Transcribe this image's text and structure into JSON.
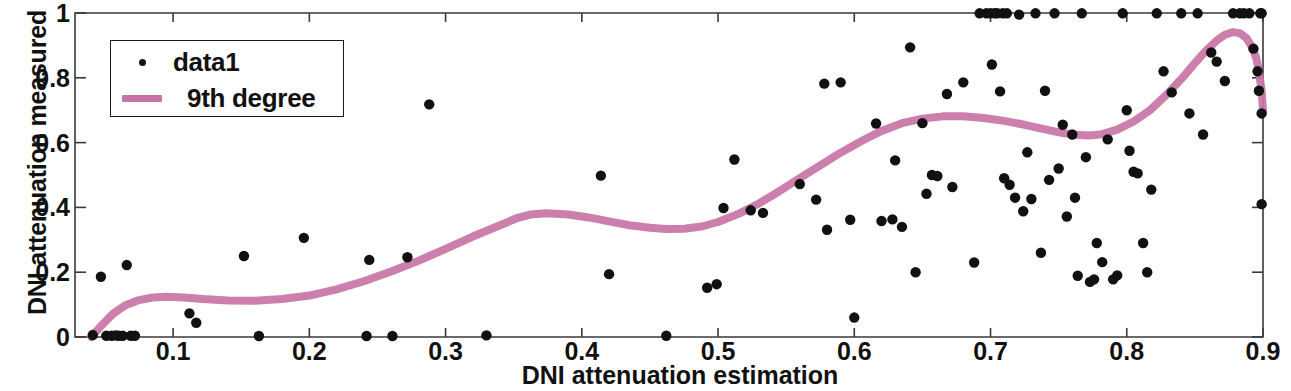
{
  "chart_data": {
    "type": "scatter",
    "title": "",
    "xlabel": "DNI attenuation estimation",
    "ylabel": "DNI attenuation measured",
    "xlim": [
      0.028,
      0.9
    ],
    "ylim": [
      0,
      1
    ],
    "xticks": [
      0.1,
      0.2,
      0.3,
      0.4,
      0.5,
      0.6,
      0.7,
      0.8,
      0.9
    ],
    "xticklabels": [
      "0.1",
      "0.2",
      "0.3",
      "0.4",
      "0.5",
      "0.6",
      "0.7",
      "0.8",
      "0.9"
    ],
    "yticks": [
      0,
      0.2,
      0.4,
      0.6,
      0.8,
      1
    ],
    "yticklabels": [
      "0",
      "0.2",
      "0.4",
      "0.6",
      "0.8",
      "1"
    ],
    "grid": false,
    "legend_position": "upper left",
    "marker_color": "#111111",
    "line_color": "#c873a6",
    "axis_color": "#3a3a3a",
    "series": [
      {
        "name": "data1",
        "type": "scatter",
        "marker": "dot",
        "color": "#111111",
        "points": [
          [
            0.041,
            0.006
          ],
          [
            0.047,
            0.186
          ],
          [
            0.051,
            0.004
          ],
          [
            0.055,
            0.004
          ],
          [
            0.058,
            0.005
          ],
          [
            0.06,
            0.004
          ],
          [
            0.063,
            0.004
          ],
          [
            0.066,
            0.222
          ],
          [
            0.069,
            0.004
          ],
          [
            0.072,
            0.004
          ],
          [
            0.112,
            0.073
          ],
          [
            0.117,
            0.044
          ],
          [
            0.152,
            0.25
          ],
          [
            0.163,
            0.003
          ],
          [
            0.196,
            0.306
          ],
          [
            0.242,
            0.003
          ],
          [
            0.244,
            0.238
          ],
          [
            0.261,
            0.003
          ],
          [
            0.272,
            0.246
          ],
          [
            0.288,
            0.718
          ],
          [
            0.33,
            0.005
          ],
          [
            0.414,
            0.498
          ],
          [
            0.42,
            0.194
          ],
          [
            0.462,
            0.004
          ],
          [
            0.492,
            0.152
          ],
          [
            0.499,
            0.163
          ],
          [
            0.504,
            0.398
          ],
          [
            0.512,
            0.548
          ],
          [
            0.524,
            0.391
          ],
          [
            0.533,
            0.383
          ],
          [
            0.56,
            0.472
          ],
          [
            0.572,
            0.424
          ],
          [
            0.578,
            0.782
          ],
          [
            0.58,
            0.331
          ],
          [
            0.59,
            0.786
          ],
          [
            0.597,
            0.362
          ],
          [
            0.6,
            0.06
          ],
          [
            0.616,
            0.659
          ],
          [
            0.62,
            0.358
          ],
          [
            0.628,
            0.363
          ],
          [
            0.63,
            0.545
          ],
          [
            0.635,
            0.34
          ],
          [
            0.641,
            0.894
          ],
          [
            0.645,
            0.2
          ],
          [
            0.65,
            0.66
          ],
          [
            0.653,
            0.442
          ],
          [
            0.657,
            0.5
          ],
          [
            0.661,
            0.497
          ],
          [
            0.668,
            0.75
          ],
          [
            0.672,
            0.463
          ],
          [
            0.68,
            0.786
          ],
          [
            0.688,
            0.23
          ],
          [
            0.692,
            0.999
          ],
          [
            0.697,
            0.999
          ],
          [
            0.7,
            0.999
          ],
          [
            0.701,
            0.841
          ],
          [
            0.703,
            0.999
          ],
          [
            0.705,
            0.999
          ],
          [
            0.707,
            0.758
          ],
          [
            0.709,
            0.999
          ],
          [
            0.71,
            0.49
          ],
          [
            0.712,
            0.999
          ],
          [
            0.714,
            0.47
          ],
          [
            0.718,
            0.43
          ],
          [
            0.721,
            0.995
          ],
          [
            0.724,
            0.388
          ],
          [
            0.727,
            0.57
          ],
          [
            0.73,
            0.426
          ],
          [
            0.733,
            0.999
          ],
          [
            0.737,
            0.26
          ],
          [
            0.74,
            0.76
          ],
          [
            0.743,
            0.485
          ],
          [
            0.747,
            0.999
          ],
          [
            0.75,
            0.52
          ],
          [
            0.753,
            0.655
          ],
          [
            0.756,
            0.372
          ],
          [
            0.76,
            0.625
          ],
          [
            0.762,
            0.43
          ],
          [
            0.764,
            0.189
          ],
          [
            0.767,
            0.999
          ],
          [
            0.77,
            0.555
          ],
          [
            0.773,
            0.17
          ],
          [
            0.776,
            0.178
          ],
          [
            0.778,
            0.29
          ],
          [
            0.782,
            0.231
          ],
          [
            0.786,
            0.61
          ],
          [
            0.79,
            0.178
          ],
          [
            0.793,
            0.19
          ],
          [
            0.797,
            0.999
          ],
          [
            0.8,
            0.7
          ],
          [
            0.802,
            0.575
          ],
          [
            0.805,
            0.51
          ],
          [
            0.808,
            0.505
          ],
          [
            0.812,
            0.29
          ],
          [
            0.815,
            0.2
          ],
          [
            0.818,
            0.455
          ],
          [
            0.822,
            0.999
          ],
          [
            0.827,
            0.82
          ],
          [
            0.833,
            0.755
          ],
          [
            0.84,
            0.999
          ],
          [
            0.846,
            0.69
          ],
          [
            0.852,
            0.999
          ],
          [
            0.856,
            0.625
          ],
          [
            0.862,
            0.878
          ],
          [
            0.866,
            0.85
          ],
          [
            0.872,
            0.79
          ],
          [
            0.878,
            0.999
          ],
          [
            0.883,
            0.999
          ],
          [
            0.886,
            0.999
          ],
          [
            0.89,
            0.999
          ],
          [
            0.893,
            0.89
          ],
          [
            0.896,
            0.82
          ],
          [
            0.897,
            0.76
          ],
          [
            0.898,
            0.999
          ],
          [
            0.899,
            0.69
          ],
          [
            0.899,
            0.41
          ],
          [
            0.899,
            0.999
          ]
        ]
      },
      {
        "name": "9th degree",
        "type": "line",
        "color": "#c873a6",
        "line_width": 8,
        "points": [
          [
            0.04,
            0.0
          ],
          [
            0.048,
            0.038
          ],
          [
            0.056,
            0.072
          ],
          [
            0.065,
            0.098
          ],
          [
            0.075,
            0.114
          ],
          [
            0.085,
            0.122
          ],
          [
            0.095,
            0.124
          ],
          [
            0.108,
            0.122
          ],
          [
            0.122,
            0.117
          ],
          [
            0.14,
            0.113
          ],
          [
            0.16,
            0.112
          ],
          [
            0.18,
            0.117
          ],
          [
            0.2,
            0.128
          ],
          [
            0.22,
            0.147
          ],
          [
            0.24,
            0.172
          ],
          [
            0.26,
            0.202
          ],
          [
            0.28,
            0.235
          ],
          [
            0.3,
            0.272
          ],
          [
            0.32,
            0.31
          ],
          [
            0.34,
            0.345
          ],
          [
            0.353,
            0.368
          ],
          [
            0.362,
            0.378
          ],
          [
            0.374,
            0.382
          ],
          [
            0.39,
            0.378
          ],
          [
            0.405,
            0.369
          ],
          [
            0.42,
            0.357
          ],
          [
            0.435,
            0.345
          ],
          [
            0.45,
            0.337
          ],
          [
            0.462,
            0.333
          ],
          [
            0.475,
            0.334
          ],
          [
            0.488,
            0.341
          ],
          [
            0.5,
            0.355
          ],
          [
            0.515,
            0.38
          ],
          [
            0.53,
            0.412
          ],
          [
            0.545,
            0.45
          ],
          [
            0.56,
            0.49
          ],
          [
            0.575,
            0.53
          ],
          [
            0.59,
            0.569
          ],
          [
            0.605,
            0.604
          ],
          [
            0.62,
            0.636
          ],
          [
            0.635,
            0.66
          ],
          [
            0.65,
            0.674
          ],
          [
            0.665,
            0.681
          ],
          [
            0.68,
            0.681
          ],
          [
            0.695,
            0.676
          ],
          [
            0.71,
            0.667
          ],
          [
            0.725,
            0.655
          ],
          [
            0.74,
            0.641
          ],
          [
            0.752,
            0.63
          ],
          [
            0.762,
            0.624
          ],
          [
            0.772,
            0.622
          ],
          [
            0.782,
            0.626
          ],
          [
            0.793,
            0.64
          ],
          [
            0.805,
            0.665
          ],
          [
            0.817,
            0.7
          ],
          [
            0.828,
            0.743
          ],
          [
            0.84,
            0.796
          ],
          [
            0.85,
            0.845
          ],
          [
            0.858,
            0.883
          ],
          [
            0.866,
            0.915
          ],
          [
            0.872,
            0.933
          ],
          [
            0.878,
            0.941
          ],
          [
            0.883,
            0.938
          ],
          [
            0.888,
            0.922
          ],
          [
            0.892,
            0.895
          ],
          [
            0.895,
            0.862
          ],
          [
            0.897,
            0.82
          ],
          [
            0.899,
            0.76
          ],
          [
            0.9,
            0.7
          ]
        ]
      }
    ],
    "legend": [
      {
        "label": "data1",
        "marker": "dot",
        "color": "#111111"
      },
      {
        "label": "9th degree",
        "marker": "line",
        "color": "#c873a6"
      }
    ]
  }
}
